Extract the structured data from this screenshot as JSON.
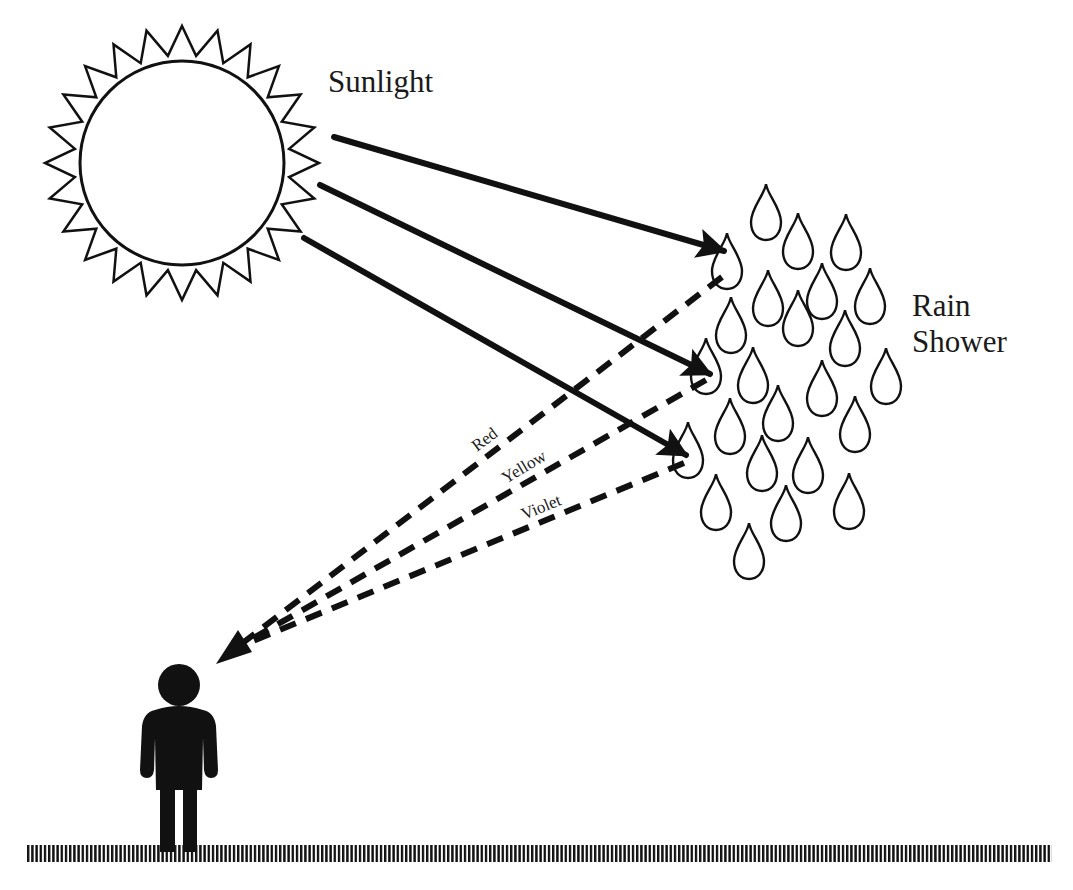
{
  "diagram": {
    "title_labels": {
      "sunlight": "Sunlight",
      "rain_line1": "Rain",
      "rain_line2": "Shower"
    },
    "color_labels": [
      {
        "name": "red",
        "text": "Red"
      },
      {
        "name": "yellow",
        "text": "Yellow"
      },
      {
        "name": "violet",
        "text": "Violet"
      }
    ],
    "icons": {
      "sun": "sun-icon",
      "raindrops": "raindrop-icon",
      "observer": "person-icon",
      "ground": "ground-icon"
    },
    "colors": {
      "stroke": "#111111",
      "background": "#ffffff"
    }
  }
}
